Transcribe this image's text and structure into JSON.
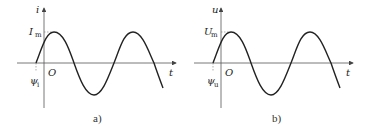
{
  "panels": [
    {
      "id": "a",
      "caption": "a)",
      "y_axis_label": "i",
      "x_axis_label": "t",
      "origin_label": "O",
      "amplitude_label": "I",
      "amplitude_sub": "m",
      "phase_label": "ψ",
      "phase_sub": "i"
    },
    {
      "id": "b",
      "caption": "b)",
      "y_axis_label": "u",
      "x_axis_label": "t",
      "origin_label": "O",
      "amplitude_label": "U",
      "amplitude_sub": "m",
      "phase_label": "ψ",
      "phase_sub": "u"
    }
  ],
  "colors": {
    "stroke": "#222222",
    "axis": "#555555"
  }
}
